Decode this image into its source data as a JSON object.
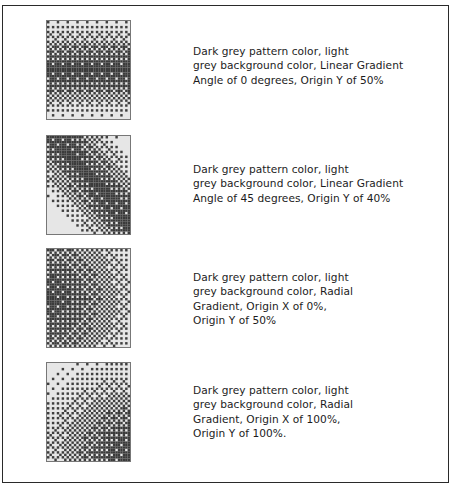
{
  "colors": {
    "pattern": "#3a3a3a",
    "background": "#e6e6e6"
  },
  "examples": [
    {
      "id": "linear-0",
      "swatch_type": "linear",
      "angle_degrees": 0,
      "origin_y_percent": 50,
      "caption_lines": [
        "Dark grey pattern color, light",
        "grey background color, Linear Gradient",
        "Angle of 0 degrees, Origin Y of 50%"
      ]
    },
    {
      "id": "linear-45",
      "swatch_type": "linear",
      "angle_degrees": 45,
      "origin_y_percent": 40,
      "caption_lines": [
        "Dark grey pattern color, light",
        "grey background color, Linear Gradient",
        "Angle of 45 degrees, Origin Y of 40%"
      ]
    },
    {
      "id": "radial-0-50",
      "swatch_type": "radial",
      "origin_x_percent": 0,
      "origin_y_percent": 50,
      "caption_lines": [
        "Dark grey pattern color, light",
        "grey background color, Radial",
        "Gradient, Origin X of 0%,",
        "Origin Y of 50%"
      ]
    },
    {
      "id": "radial-100-100",
      "swatch_type": "radial",
      "origin_x_percent": 100,
      "origin_y_percent": 100,
      "caption_lines": [
        "Dark grey pattern color, light",
        "grey background color, Radial",
        "Gradient, Origin X of 100%,",
        "Origin Y of 100%."
      ]
    }
  ]
}
